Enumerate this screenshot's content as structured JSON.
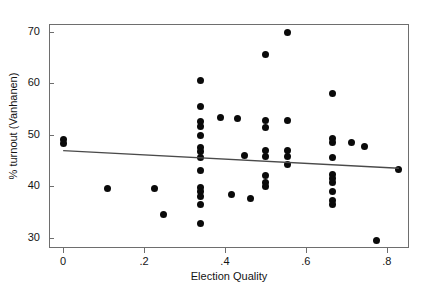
{
  "chart_data": {
    "type": "scatter",
    "title": "",
    "xlabel": "Election Quality",
    "ylabel": "% turnout (Vanhanen)",
    "xlim": [
      -0.035,
      0.855
    ],
    "ylim": [
      28.0,
      71.5
    ],
    "xticks": [
      0,
      0.2,
      0.4,
      0.6,
      0.8
    ],
    "xticklabels": [
      "0",
      ".2",
      ".4",
      ".6",
      ".8"
    ],
    "yticks": [
      30,
      40,
      50,
      60,
      70
    ],
    "yticklabels": [
      "30",
      "40",
      "50",
      "60",
      "70"
    ],
    "grid": false,
    "legend": null,
    "marker": "filled-circle",
    "marker_color": "#0a0a0a",
    "frame_color": "#6e6e6e",
    "background": "#ffffff",
    "fit_line": {
      "type": "linear",
      "color": "#4a4a4a",
      "x_start": 0.0,
      "y_start": 46.9,
      "x_end": 0.83,
      "y_end": 43.5
    },
    "points": [
      {
        "x": 0.0,
        "y": 49.0
      },
      {
        "x": 0.0,
        "y": 48.2
      },
      {
        "x": 0.11,
        "y": 39.6
      },
      {
        "x": 0.225,
        "y": 39.6
      },
      {
        "x": 0.247,
        "y": 34.5
      },
      {
        "x": 0.34,
        "y": 60.5
      },
      {
        "x": 0.34,
        "y": 55.4
      },
      {
        "x": 0.34,
        "y": 52.6
      },
      {
        "x": 0.34,
        "y": 51.6
      },
      {
        "x": 0.34,
        "y": 49.9
      },
      {
        "x": 0.34,
        "y": 47.6
      },
      {
        "x": 0.34,
        "y": 46.8
      },
      {
        "x": 0.34,
        "y": 45.6
      },
      {
        "x": 0.34,
        "y": 43.0
      },
      {
        "x": 0.34,
        "y": 39.7
      },
      {
        "x": 0.34,
        "y": 38.9
      },
      {
        "x": 0.34,
        "y": 38.0
      },
      {
        "x": 0.34,
        "y": 36.5
      },
      {
        "x": 0.34,
        "y": 32.7
      },
      {
        "x": 0.39,
        "y": 53.4
      },
      {
        "x": 0.415,
        "y": 38.4
      },
      {
        "x": 0.43,
        "y": 53.2
      },
      {
        "x": 0.448,
        "y": 45.9
      },
      {
        "x": 0.462,
        "y": 37.6
      },
      {
        "x": 0.5,
        "y": 65.6
      },
      {
        "x": 0.5,
        "y": 52.8
      },
      {
        "x": 0.5,
        "y": 51.4
      },
      {
        "x": 0.5,
        "y": 46.9
      },
      {
        "x": 0.5,
        "y": 45.8
      },
      {
        "x": 0.5,
        "y": 42.0
      },
      {
        "x": 0.5,
        "y": 40.7
      },
      {
        "x": 0.5,
        "y": 39.9
      },
      {
        "x": 0.555,
        "y": 69.8
      },
      {
        "x": 0.555,
        "y": 52.8
      },
      {
        "x": 0.555,
        "y": 46.9
      },
      {
        "x": 0.555,
        "y": 45.8
      },
      {
        "x": 0.555,
        "y": 44.3
      },
      {
        "x": 0.667,
        "y": 58.1
      },
      {
        "x": 0.667,
        "y": 49.3
      },
      {
        "x": 0.667,
        "y": 48.4
      },
      {
        "x": 0.667,
        "y": 45.5
      },
      {
        "x": 0.667,
        "y": 42.3
      },
      {
        "x": 0.667,
        "y": 41.5
      },
      {
        "x": 0.667,
        "y": 40.7
      },
      {
        "x": 0.667,
        "y": 39.0
      },
      {
        "x": 0.667,
        "y": 37.2
      },
      {
        "x": 0.667,
        "y": 36.5
      },
      {
        "x": 0.712,
        "y": 48.5
      },
      {
        "x": 0.745,
        "y": 47.8
      },
      {
        "x": 0.775,
        "y": 29.5
      },
      {
        "x": 0.83,
        "y": 43.2
      }
    ]
  }
}
